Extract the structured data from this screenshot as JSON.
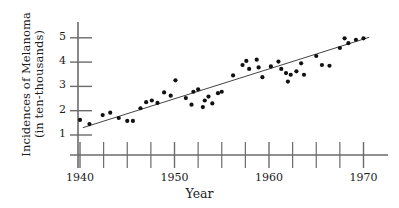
{
  "chart_data": {
    "type": "scatter",
    "title": "",
    "xlabel": "Year",
    "ylabel": "Incidences of Melanoma (in ten-thousands)",
    "ylabel_lines": [
      "Incidences of Melanoma",
      "(in ten-thousands)"
    ],
    "xlim": [
      1939.2,
      1971.5
    ],
    "ylim": [
      0.55,
      5.75
    ],
    "grid": false,
    "legend": null,
    "xticks_major": [
      1940,
      1950,
      1960,
      1970
    ],
    "xtick_labels": [
      "1940",
      "1950",
      "1960",
      "1970"
    ],
    "xticks_minor": [
      1942.5,
      1945,
      1947.5,
      1952.5,
      1955,
      1957.5,
      1962.5,
      1965,
      1967.5
    ],
    "yticks": [
      1,
      2,
      3,
      4,
      5
    ],
    "ytick_labels": [
      "1",
      "2",
      "3",
      "4",
      "5"
    ],
    "marker": "filled-circle",
    "marker_color": "#111111",
    "line_color": "#444444",
    "axis_color": "#6b6b6b",
    "background": "#ffffff",
    "trendline": {
      "x": [
        1940.3,
        1970.6
      ],
      "y": [
        1.3,
        5.02
      ],
      "label": "least-squares regression line"
    },
    "points": [
      {
        "x": 1940.0,
        "y": 1.62
      },
      {
        "x": 1941.0,
        "y": 1.45
      },
      {
        "x": 1942.4,
        "y": 1.82
      },
      {
        "x": 1943.2,
        "y": 1.92
      },
      {
        "x": 1944.1,
        "y": 1.7
      },
      {
        "x": 1945.0,
        "y": 1.58
      },
      {
        "x": 1945.6,
        "y": 1.58
      },
      {
        "x": 1946.4,
        "y": 2.1
      },
      {
        "x": 1947.0,
        "y": 2.35
      },
      {
        "x": 1947.6,
        "y": 2.42
      },
      {
        "x": 1948.2,
        "y": 2.32
      },
      {
        "x": 1948.9,
        "y": 2.75
      },
      {
        "x": 1949.6,
        "y": 2.62
      },
      {
        "x": 1950.1,
        "y": 3.25
      },
      {
        "x": 1951.2,
        "y": 2.52
      },
      {
        "x": 1952.0,
        "y": 2.78
      },
      {
        "x": 1952.5,
        "y": 2.88
      },
      {
        "x": 1951.8,
        "y": 2.25
      },
      {
        "x": 1953.0,
        "y": 2.15
      },
      {
        "x": 1953.2,
        "y": 2.42
      },
      {
        "x": 1953.6,
        "y": 2.58
      },
      {
        "x": 1954.0,
        "y": 2.3
      },
      {
        "x": 1954.6,
        "y": 2.72
      },
      {
        "x": 1955.0,
        "y": 2.78
      },
      {
        "x": 1956.2,
        "y": 3.45
      },
      {
        "x": 1957.2,
        "y": 3.88
      },
      {
        "x": 1957.6,
        "y": 4.05
      },
      {
        "x": 1957.9,
        "y": 3.72
      },
      {
        "x": 1958.7,
        "y": 4.1
      },
      {
        "x": 1958.9,
        "y": 3.78
      },
      {
        "x": 1959.3,
        "y": 3.38
      },
      {
        "x": 1960.2,
        "y": 3.82
      },
      {
        "x": 1961.0,
        "y": 4.02
      },
      {
        "x": 1961.3,
        "y": 3.72
      },
      {
        "x": 1961.8,
        "y": 3.55
      },
      {
        "x": 1962.0,
        "y": 3.2
      },
      {
        "x": 1962.3,
        "y": 3.48
      },
      {
        "x": 1962.9,
        "y": 3.62
      },
      {
        "x": 1963.4,
        "y": 3.95
      },
      {
        "x": 1963.7,
        "y": 3.48
      },
      {
        "x": 1965.0,
        "y": 4.25
      },
      {
        "x": 1965.6,
        "y": 3.88
      },
      {
        "x": 1966.4,
        "y": 3.85
      },
      {
        "x": 1967.5,
        "y": 4.58
      },
      {
        "x": 1968.0,
        "y": 4.98
      },
      {
        "x": 1968.4,
        "y": 4.78
      },
      {
        "x": 1969.2,
        "y": 4.92
      },
      {
        "x": 1970.0,
        "y": 4.98
      }
    ]
  },
  "axes": {
    "x_axis_name": "year-axis",
    "y_axis_name": "incidences-axis"
  }
}
